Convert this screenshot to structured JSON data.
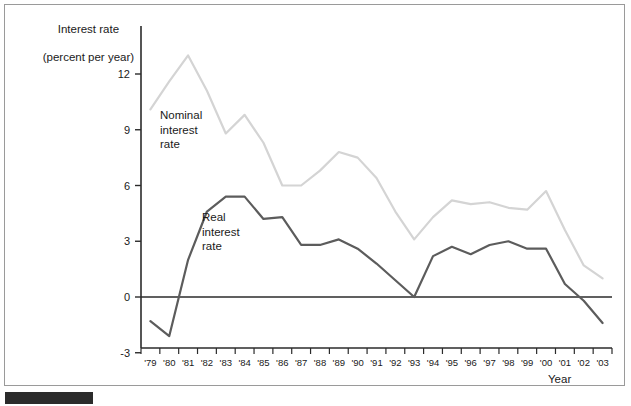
{
  "figure": {
    "background_color": "#ffffff",
    "frame_color": "#9a9a9a",
    "rule_color": "#2b2b2b"
  },
  "labels": {
    "y_axis_title_line1": "Interest rate",
    "y_axis_title_line2": "(percent per year)",
    "x_axis_title": "Year",
    "series_nominal_line1": "Nominal",
    "series_nominal_line2": "interest",
    "series_nominal_line3": "rate",
    "series_real_line1": "Real",
    "series_real_line2": "interest",
    "series_real_line3": "rate"
  },
  "chart_data": {
    "type": "line",
    "title": "",
    "subtitle": "",
    "xlabel": "Year",
    "ylabel": "Interest rate (percent per year)",
    "grid": false,
    "legend_position": "inline-annotation",
    "xlim": [
      "'79",
      "'03"
    ],
    "ylim": [
      -3,
      13.5
    ],
    "ytick_labels": [
      "12",
      "9",
      "6",
      "3",
      "0",
      "-3"
    ],
    "yticks": [
      12,
      9,
      6,
      3,
      0,
      -3
    ],
    "zero_line": true,
    "categories": [
      "'79",
      "'80",
      "'81",
      "'82",
      "'83",
      "'84",
      "'85",
      "'86",
      "'87",
      "'88",
      "'89",
      "'90",
      "'91",
      "'92",
      "'93",
      "'94",
      "'95",
      "'96",
      "'97",
      "'98",
      "'99",
      "'00",
      "'01",
      "'02",
      "'03"
    ],
    "series": [
      {
        "name": "Nominal interest rate",
        "color": "#d4d4d4",
        "values": [
          10.1,
          11.6,
          13.0,
          11.1,
          8.8,
          9.8,
          8.3,
          6.0,
          6.0,
          6.8,
          7.8,
          7.5,
          6.4,
          4.6,
          3.1,
          4.3,
          5.2,
          5.0,
          5.1,
          4.8,
          4.7,
          5.7,
          3.6,
          1.7,
          1.0
        ],
        "linewidth": 2.2
      },
      {
        "name": "Real interest rate",
        "color": "#5c5c5c",
        "values": [
          -1.3,
          -2.1,
          2.0,
          4.6,
          5.4,
          5.4,
          4.2,
          4.3,
          2.8,
          2.8,
          3.1,
          2.6,
          1.8,
          0.9,
          0.0,
          2.2,
          2.7,
          2.3,
          2.8,
          3.0,
          2.6,
          2.6,
          0.7,
          -0.2,
          -1.4
        ],
        "linewidth": 2.2
      }
    ]
  },
  "axes": {
    "y_axis_color": "#2b2b2b",
    "x_axis_color": "#2b2b2b",
    "tick_color": "#2b2b2b"
  }
}
